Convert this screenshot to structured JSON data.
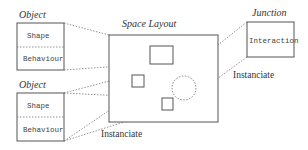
{
  "diagram": {
    "object_top": {
      "title": "Object",
      "fields": [
        "Shape",
        "Behaviour"
      ]
    },
    "object_bottom": {
      "title": "Object",
      "fields": [
        "Shape",
        "Behaviour"
      ]
    },
    "space_layout": {
      "title": "Space Layout"
    },
    "junction": {
      "title": "Junction",
      "field": "Interaction"
    },
    "labels": {
      "instanciate_junction": "Instanciate",
      "instanciate_objects": "Instanciate"
    }
  }
}
